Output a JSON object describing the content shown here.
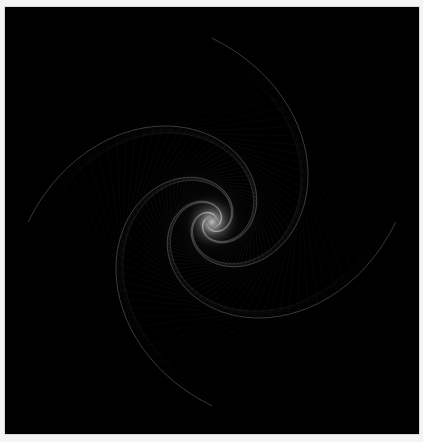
{
  "artwork": {
    "subject": "spiral of rotating nested squares",
    "background_color": "#000000",
    "frame_color": "#f4f4f4",
    "line_color": "#ffffff",
    "glow_color": "#ffffff",
    "center": [
      207,
      215
    ],
    "polygon_sides": 4,
    "steps": 90,
    "start_size": 260,
    "shrink": 0.965,
    "rotate_deg": 4.2,
    "arms": 4
  }
}
